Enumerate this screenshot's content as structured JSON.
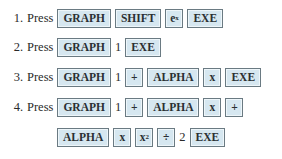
{
  "steps": [
    {
      "number": "1.",
      "verb": "Press",
      "items": [
        {
          "type": "key",
          "label": "GRAPH"
        },
        {
          "type": "key",
          "label": "SHIFT"
        },
        {
          "type": "key",
          "label": "e",
          "sup": "x"
        },
        {
          "type": "key",
          "label": "EXE"
        }
      ]
    },
    {
      "number": "2.",
      "verb": "Press",
      "items": [
        {
          "type": "key",
          "label": "GRAPH"
        },
        {
          "type": "text",
          "label": "1"
        },
        {
          "type": "key",
          "label": "EXE"
        }
      ]
    },
    {
      "number": "3.",
      "verb": "Press",
      "items": [
        {
          "type": "key",
          "label": "GRAPH"
        },
        {
          "type": "text",
          "label": "1"
        },
        {
          "type": "key",
          "label": "+"
        },
        {
          "type": "key",
          "label": "ALPHA"
        },
        {
          "type": "key",
          "label": "x"
        },
        {
          "type": "key",
          "label": "EXE"
        }
      ]
    },
    {
      "number": "4.",
      "verb": "Press",
      "items": [
        {
          "type": "key",
          "label": "GRAPH"
        },
        {
          "type": "text",
          "label": "1"
        },
        {
          "type": "key",
          "label": "+"
        },
        {
          "type": "key",
          "label": "ALPHA"
        },
        {
          "type": "key",
          "label": "x"
        },
        {
          "type": "key",
          "label": "+"
        }
      ]
    },
    {
      "number": "",
      "verb": "",
      "items": [
        {
          "type": "key",
          "label": "ALPHA"
        },
        {
          "type": "key",
          "label": "x"
        },
        {
          "type": "key",
          "label": "x",
          "sup": "2"
        },
        {
          "type": "key",
          "label": "÷"
        },
        {
          "type": "text",
          "label": "2"
        },
        {
          "type": "key",
          "label": "EXE"
        }
      ]
    }
  ],
  "colors": {
    "key_fill": "#d6e7f0",
    "key_border": "#6a7a82",
    "text": "#2a2a2a"
  }
}
